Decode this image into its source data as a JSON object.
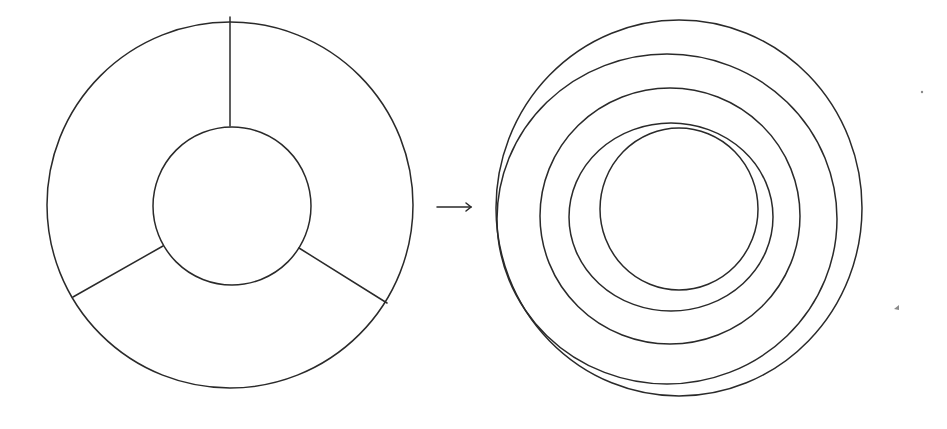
{
  "diagram": {
    "stroke_color": "#2a2a2a",
    "background": "#ffffff",
    "left_figure": {
      "name": "three-sector-annulus",
      "outer_circle": {
        "cx": 230,
        "cy": 205,
        "r": 183
      },
      "inner_circle": {
        "cx": 232,
        "cy": 206,
        "r": 79
      },
      "spokes": [
        {
          "x1": 230,
          "y1": 17,
          "x2": 230,
          "y2": 126
        },
        {
          "x1": 73,
          "y1": 297,
          "x2": 163,
          "y2": 246
        },
        {
          "x1": 387,
          "y1": 303,
          "x2": 299,
          "y2": 248
        }
      ]
    },
    "arrow": {
      "x1": 437,
      "y1": 207,
      "x2": 471,
      "y2": 207,
      "glyph": "→"
    },
    "right_figure": {
      "name": "three-arm-spiral",
      "rings": [
        {
          "cx": 679,
          "cy": 208,
          "rx": 183,
          "ry": 188
        },
        {
          "cx": 667,
          "cy": 219,
          "rx": 170,
          "ry": 165
        },
        {
          "cx": 670,
          "cy": 216,
          "rx": 130,
          "ry": 128
        },
        {
          "cx": 671,
          "cy": 217,
          "rx": 102,
          "ry": 94
        },
        {
          "cx": 679,
          "cy": 209,
          "rx": 79,
          "ry": 81
        }
      ]
    },
    "specks": [
      {
        "x": 898,
        "y": 308,
        "size": 4
      },
      {
        "x": 922,
        "y": 92,
        "size": 1.2
      }
    ]
  }
}
